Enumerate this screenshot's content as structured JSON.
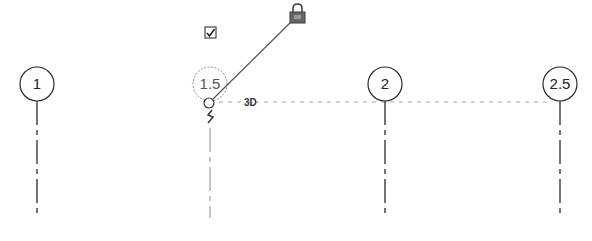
{
  "view": {
    "colors": {
      "background": "#ffffff",
      "grid_line": "#2a2a2a",
      "selected_grid": "#8a8a8a",
      "alignment_line": "#a8a8a8",
      "lock": "#3a3a3a"
    }
  },
  "grids": [
    {
      "label": "1",
      "selected": false
    },
    {
      "label": "1.5",
      "selected": true
    },
    {
      "label": "2",
      "selected": false
    },
    {
      "label": "2.5",
      "selected": false
    }
  ],
  "selection_controls": {
    "extent_label": "3D",
    "show_bubble_checkbox": {
      "checked": true,
      "icon": "checkbox-checked-icon"
    },
    "lock": {
      "locked": true,
      "icon": "padlock-icon"
    },
    "elbow_icon": "add-elbow-icon",
    "drag_handle_icon": "drag-end-circle-icon"
  }
}
